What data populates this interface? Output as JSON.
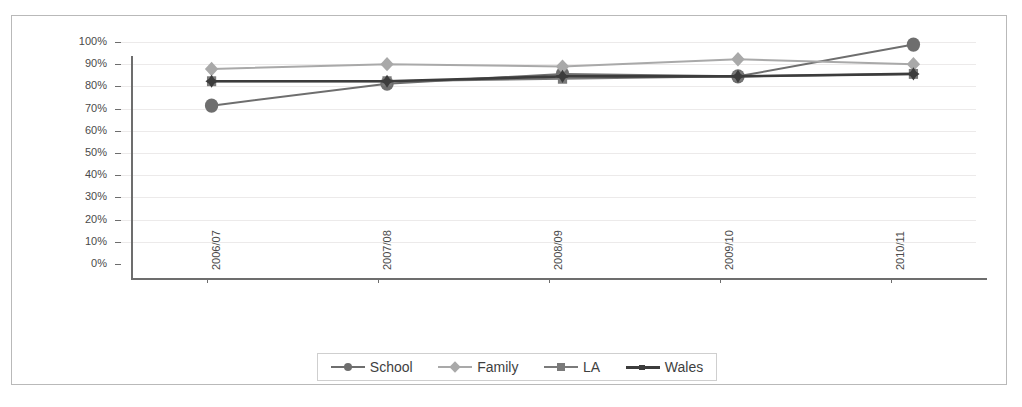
{
  "chart_data": {
    "type": "line",
    "title": "",
    "subtitle": "",
    "xlabel": "",
    "ylabel": "",
    "categories": [
      "2006/07",
      "2007/08",
      "2008/09",
      "2009/10",
      "2010/11"
    ],
    "series": [
      {
        "name": "School",
        "marker": "circle",
        "color": "#6e6e6e",
        "values": [
          75,
          84,
          88,
          87,
          100
        ]
      },
      {
        "name": "Family",
        "marker": "diamond",
        "color": "#a9a9a9",
        "values": [
          90,
          92,
          91,
          94,
          92
        ]
      },
      {
        "name": "LA",
        "marker": "square",
        "color": "#7a7a7a",
        "values": [
          85,
          85,
          86,
          87,
          88
        ]
      },
      {
        "name": "Wales",
        "marker": "dash",
        "color": "#3c3c3c",
        "values": [
          85,
          85,
          87,
          87,
          88
        ]
      }
    ],
    "ylim": [
      0,
      100
    ],
    "ytick_labels": [
      "0%",
      "10%",
      "20%",
      "30%",
      "40%",
      "50%",
      "60%",
      "70%",
      "80%",
      "90%",
      "100%"
    ],
    "ytick_values": [
      0,
      10,
      20,
      30,
      40,
      50,
      60,
      70,
      80,
      90,
      100
    ],
    "grid": true,
    "grid_color": "#eceaea",
    "legend_position": "bottom",
    "y_axis_format": "percent",
    "x_tick_label_rotation": -90
  },
  "legend": {
    "items": [
      {
        "label": "School"
      },
      {
        "label": "Family"
      },
      {
        "label": "LA"
      },
      {
        "label": "Wales"
      }
    ]
  },
  "colors": {
    "axis": "#6d6d6d",
    "grid": "#eceaea",
    "frame": "#b9b9b9",
    "text": "#4a4a4a",
    "school": "#6e6e6e",
    "family": "#a9a9a9",
    "la": "#7a7a7a",
    "wales": "#3c3c3c"
  }
}
